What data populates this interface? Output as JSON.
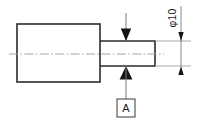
{
  "drawing": {
    "title": "Stepped shaft orthographic view with datum feature",
    "type": "engineering-drawing",
    "canvas": {
      "width": 200,
      "height": 127,
      "background": "#ffffff"
    },
    "colors": {
      "outline": "#2b2b2b",
      "centerline": "#9a9a9a",
      "thin_line": "#7d7d7d",
      "arrow": "#141414",
      "text": "#1a1a1a",
      "box_stroke": "#4a4a4a"
    },
    "geometry": {
      "large_body": {
        "x": 17,
        "y": 24,
        "width": 83,
        "height": 58
      },
      "shaft": {
        "x": 100,
        "y": 41,
        "width": 55,
        "height": 25
      },
      "centerline": {
        "x1": 9,
        "y1": 54,
        "x2": 164,
        "y2": 54
      }
    },
    "dimension": {
      "label": "φ10",
      "symbol": "diameter-symbol",
      "value": "10",
      "orientation": "vertical-rotated",
      "line_x": 181,
      "from_y": 41,
      "to_y": 66,
      "extension_from_x": 155,
      "extension_to_x": 190
    },
    "datum": {
      "label": "A",
      "box": {
        "x": 117,
        "y": 99,
        "width": 18,
        "height": 18
      },
      "leader_x": 126,
      "leader_from_y": 66,
      "leader_to_y": 99,
      "triangle_apex_y": 66,
      "symbol": "datum-feature-triangle"
    },
    "top_indicator": {
      "leader_x": 126,
      "leader_from_y": 13,
      "leader_to_y": 41,
      "triangle_apex_y": 41,
      "symbol": "datum-feature-triangle-down"
    }
  }
}
